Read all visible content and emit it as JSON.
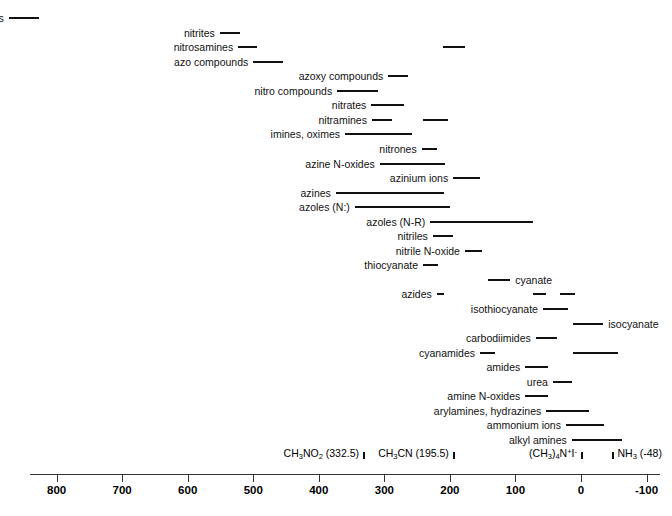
{
  "chart_data": {
    "type": "bar",
    "title": "",
    "xlabel": "",
    "ylabel": "",
    "orientation": "horizontal-ranges",
    "axis": {
      "ticks": [
        800,
        700,
        600,
        500,
        400,
        300,
        200,
        100,
        0,
        -100
      ],
      "tick_labels": [
        "800",
        "700",
        "600",
        "500",
        "400",
        "300",
        "200",
        "100",
        "0",
        "-100"
      ],
      "xlim": [
        860,
        -120
      ],
      "reversed": true,
      "grid": false
    },
    "references": [
      {
        "label_html": "CH<sub>3</sub>NO<sub>2</sub> (332.5)",
        "value": 332.5,
        "align": "left"
      },
      {
        "label_html": "CH<sub>3</sub>CN (195.5)",
        "value": 195.5,
        "align": "left"
      },
      {
        "label_html": "(CH<sub>3</sub>)<sub>4</sub>N<sup>+</sup>I<sup>-</sup>",
        "value": 0,
        "align": "left"
      },
      {
        "label_html": "NH<sub>3</sub> (-48)",
        "value": -48,
        "align": "right"
      }
    ],
    "rows": [
      {
        "label": "nitroso compounds",
        "label_side": "right",
        "ranges": [
          [
            873,
            827
          ]
        ]
      },
      {
        "label": "nitrites",
        "label_side": "right",
        "ranges": [
          [
            551,
            520
          ]
        ]
      },
      {
        "label": "nitrosamines",
        "label_side": "right",
        "ranges": [
          [
            523,
            494
          ],
          [
            210,
            177
          ]
        ]
      },
      {
        "label": "azo compounds",
        "label_side": "right",
        "ranges": [
          [
            500,
            455
          ]
        ]
      },
      {
        "label": "azoxy compounds",
        "label_side": "right",
        "ranges": [
          [
            294,
            264
          ]
        ]
      },
      {
        "label": "nitro compounds",
        "label_side": "right",
        "ranges": [
          [
            372,
            310
          ]
        ]
      },
      {
        "label": "nitrates",
        "label_side": "right",
        "ranges": [
          [
            320,
            270
          ]
        ]
      },
      {
        "label": "nitramines",
        "label_side": "right",
        "ranges": [
          [
            319,
            288
          ],
          [
            241,
            203
          ]
        ]
      },
      {
        "label": "imines, oximes",
        "label_side": "right",
        "ranges": [
          [
            360,
            258
          ]
        ]
      },
      {
        "label": "nitrones",
        "label_side": "right",
        "ranges": [
          [
            243,
            220
          ]
        ]
      },
      {
        "label": "azine N-oxides",
        "label_side": "right",
        "ranges": [
          [
            307,
            207
          ]
        ]
      },
      {
        "label": "azinium ions",
        "label_side": "right",
        "ranges": [
          [
            195,
            154
          ]
        ]
      },
      {
        "label": "azines",
        "label_side": "right",
        "ranges": [
          [
            374,
            209
          ]
        ]
      },
      {
        "label": "azoles (N:)",
        "label_side": "right",
        "ranges": [
          [
            345,
            200
          ]
        ]
      },
      {
        "label": "azoles (N-R)",
        "label_side": "right",
        "ranges": [
          [
            230,
            73
          ]
        ]
      },
      {
        "label": "nitriles",
        "label_side": "right",
        "ranges": [
          [
            226,
            195
          ]
        ]
      },
      {
        "label": "nitrile N-oxide",
        "label_side": "right",
        "ranges": [
          [
            177,
            151
          ]
        ]
      },
      {
        "label": "thiocyanate",
        "label_side": "right",
        "ranges": [
          [
            241,
            218
          ]
        ]
      },
      {
        "label": "cyanate",
        "label_side": "left",
        "ranges": [
          [
            142,
            108
          ]
        ]
      },
      {
        "label": "azides",
        "label_side": "right",
        "ranges": [
          [
            220,
            209
          ],
          [
            73,
            53
          ],
          [
            32,
            9
          ]
        ]
      },
      {
        "label": "isothiocyanate",
        "label_side": "right",
        "ranges": [
          [
            58,
            20
          ]
        ]
      },
      {
        "label": "isocyanate",
        "label_side": "left",
        "ranges": [
          [
            12,
            -34
          ]
        ]
      },
      {
        "label": "carbodiimides",
        "label_side": "right",
        "ranges": [
          [
            69,
            37
          ]
        ]
      },
      {
        "label": "cyanamides",
        "label_side": "right",
        "ranges": [
          [
            154,
            131
          ],
          [
            12,
            -56
          ]
        ]
      },
      {
        "label": "amides",
        "label_side": "right",
        "ranges": [
          [
            85,
            50
          ]
        ]
      },
      {
        "label": "urea",
        "label_side": "right",
        "ranges": [
          [
            43,
            14
          ]
        ]
      },
      {
        "label": "amine N-oxides",
        "label_side": "right",
        "ranges": [
          [
            85,
            50
          ]
        ]
      },
      {
        "label": "arylamines, hydrazines",
        "label_side": "right",
        "ranges": [
          [
            53,
            -12
          ]
        ]
      },
      {
        "label": "ammonium ions",
        "label_side": "right",
        "ranges": [
          [
            23,
            -35
          ]
        ]
      },
      {
        "label": "alkyl amines",
        "label_side": "right",
        "ranges": [
          [
            14,
            -63
          ]
        ]
      }
    ]
  }
}
